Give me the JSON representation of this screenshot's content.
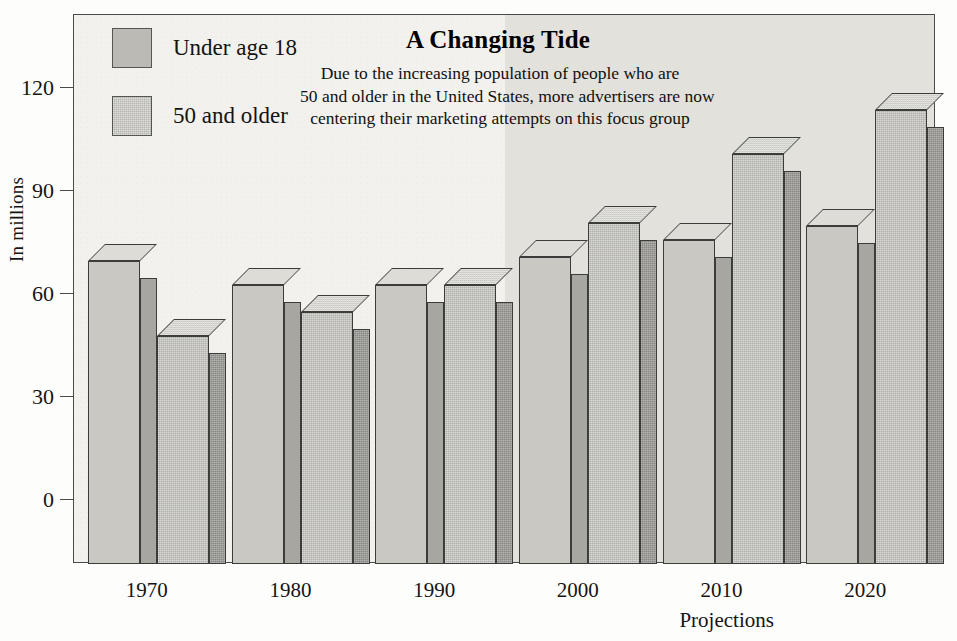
{
  "chart_data": {
    "type": "bar",
    "title": "A Changing Tide",
    "subtitle_lines": [
      "Due to the increasing population of people who are",
      "50 and older in the United States, more advertisers are now",
      "centering their marketing attempts on this focus group"
    ],
    "xlabel": "Projections",
    "ylabel": "In millions",
    "categories": [
      "1970",
      "1980",
      "1990",
      "2000",
      "2010",
      "2020"
    ],
    "ylim": [
      0,
      130
    ],
    "yticks": [
      0,
      30,
      60,
      90,
      120
    ],
    "ytick_labels": [
      "0",
      "30",
      "60",
      "90",
      "120"
    ],
    "grid": false,
    "legend_position": "top-left",
    "series": [
      {
        "name": "Under age 18",
        "values": [
          70,
          63,
          63,
          71,
          76,
          80
        ],
        "color": "#c9c8c3"
      },
      {
        "name": "50 and older",
        "values": [
          48,
          55,
          63,
          81,
          101,
          114
        ],
        "color": "#b0afaa"
      }
    ],
    "annotations": [
      {
        "label": "Projections shaded region",
        "from_category": "2000",
        "to_category": "2020",
        "color": "#e2e1dc"
      }
    ]
  },
  "figure": {
    "background_color": "#fdfdfc",
    "plot_background_color": "#f2f1ee",
    "frame_color": "#4a4a48"
  }
}
